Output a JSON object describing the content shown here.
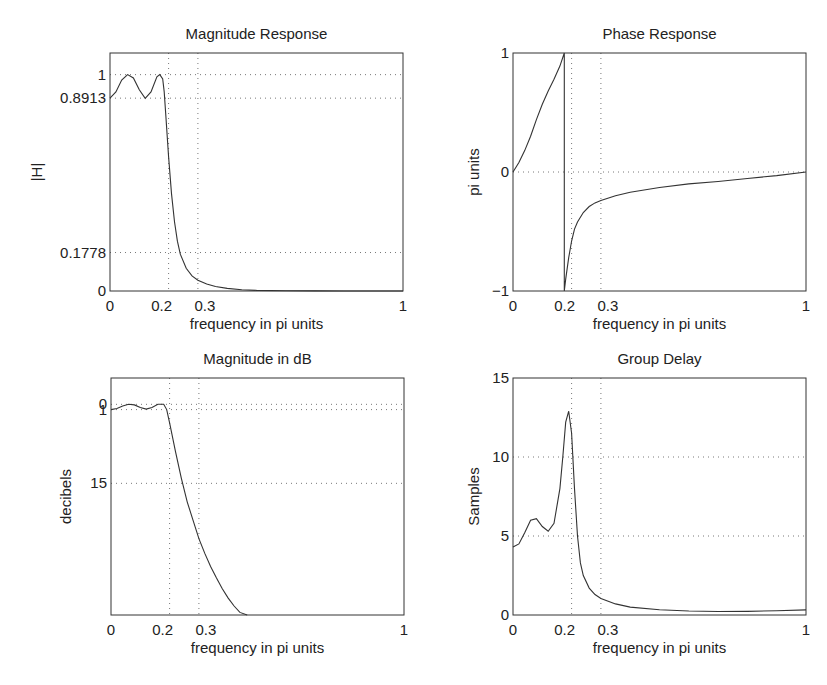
{
  "chart_data": [
    {
      "type": "line",
      "id": "mag",
      "title": "Magnitude Response",
      "xlabel": "frequency in pi units",
      "ylabel": "|H|",
      "xlim": [
        0,
        1
      ],
      "ylim": [
        0,
        1.1
      ],
      "xticks": [
        0,
        0.2,
        0.3,
        1
      ],
      "xtick_labels": [
        "0",
        "0.2",
        "0.3",
        "1"
      ],
      "yticks": [
        0,
        0.1778,
        0.8913,
        1
      ],
      "ytick_labels": [
        "0",
        "0.1778",
        "0.8913",
        "1"
      ],
      "grid": true,
      "box": {
        "x": 110,
        "y": 53,
        "w": 293,
        "h": 238
      },
      "x": [
        0,
        0.02,
        0.04,
        0.06,
        0.08,
        0.1,
        0.12,
        0.14,
        0.16,
        0.17,
        0.18,
        0.185,
        0.19,
        0.2,
        0.21,
        0.22,
        0.23,
        0.24,
        0.26,
        0.28,
        0.3,
        0.33,
        0.36,
        0.4,
        0.45,
        0.5,
        0.6,
        0.7,
        0.8,
        0.9,
        1.0
      ],
      "values": [
        0.8913,
        0.92,
        0.975,
        1.0,
        0.985,
        0.93,
        0.89,
        0.92,
        0.99,
        1.0,
        0.98,
        0.92,
        0.82,
        0.62,
        0.45,
        0.32,
        0.23,
        0.17,
        0.105,
        0.07,
        0.05,
        0.032,
        0.021,
        0.012,
        0.006,
        0.003,
        0.001,
        0.0005,
        0.0002,
        0.0001,
        0.0
      ]
    },
    {
      "type": "line",
      "id": "phase",
      "title": "Phase Response",
      "xlabel": "frequency in pi units",
      "ylabel": "pi units",
      "xlim": [
        0,
        1
      ],
      "ylim": [
        -1,
        1
      ],
      "xticks": [
        0,
        0.2,
        0.3,
        1
      ],
      "xtick_labels": [
        "0",
        "0.2",
        "0.3",
        "1"
      ],
      "yticks": [
        -1,
        0,
        1
      ],
      "ytick_labels": [
        "−1",
        "0",
        "1"
      ],
      "grid": true,
      "box": {
        "x": 513,
        "y": 53,
        "w": 293,
        "h": 238
      },
      "x": [
        0,
        0.02,
        0.04,
        0.06,
        0.08,
        0.1,
        0.12,
        0.14,
        0.16,
        0.175,
        0.175,
        0.18,
        0.19,
        0.2,
        0.21,
        0.22,
        0.24,
        0.26,
        0.28,
        0.3,
        0.35,
        0.4,
        0.5,
        0.6,
        0.7,
        0.8,
        0.9,
        1.0
      ],
      "values": [
        0.0,
        0.08,
        0.18,
        0.3,
        0.44,
        0.57,
        0.68,
        0.78,
        0.89,
        1.0,
        -1.0,
        -0.9,
        -0.72,
        -0.58,
        -0.48,
        -0.42,
        -0.34,
        -0.29,
        -0.26,
        -0.24,
        -0.2,
        -0.17,
        -0.13,
        -0.1,
        -0.08,
        -0.055,
        -0.03,
        0.0
      ]
    },
    {
      "type": "line",
      "id": "db",
      "title": "Magnitude in dB",
      "xlabel": "frequency in pi units",
      "ylabel": "decibels",
      "xlim": [
        0,
        1
      ],
      "ylim": [
        -40,
        5
      ],
      "xticks": [
        0,
        0.2,
        0.3,
        1
      ],
      "xtick_labels": [
        "0",
        "0.2",
        "0.3",
        "1"
      ],
      "yticks": [
        0,
        -1,
        -15
      ],
      "ytick_labels": [
        "0",
        "1",
        "15"
      ],
      "grid": true,
      "box": {
        "x": 111,
        "y": 378,
        "w": 293,
        "h": 237
      },
      "x": [
        0,
        0.02,
        0.04,
        0.06,
        0.08,
        0.1,
        0.12,
        0.14,
        0.16,
        0.18,
        0.19,
        0.2,
        0.22,
        0.24,
        0.26,
        0.28,
        0.3,
        0.32,
        0.34,
        0.36,
        0.38,
        0.4,
        0.42,
        0.44,
        0.465
      ],
      "values": [
        -1.0,
        -0.8,
        -0.3,
        0.0,
        -0.1,
        -0.6,
        -0.9,
        -0.6,
        0.0,
        0.0,
        -1.0,
        -3.5,
        -9,
        -14,
        -18.5,
        -22,
        -25.5,
        -28.3,
        -30.8,
        -33.0,
        -35.0,
        -36.8,
        -38.3,
        -39.5,
        -40.0
      ]
    },
    {
      "type": "line",
      "id": "gd",
      "title": "Group Delay",
      "xlabel": "frequency in pi units",
      "ylabel": "Samples",
      "xlim": [
        0,
        1
      ],
      "ylim": [
        0,
        15
      ],
      "xticks": [
        0,
        0.2,
        0.3,
        1
      ],
      "xtick_labels": [
        "0",
        "0.2",
        "0.3",
        "1"
      ],
      "yticks": [
        0,
        5,
        10,
        15
      ],
      "ytick_labels": [
        "0",
        "5",
        "10",
        "15"
      ],
      "grid": true,
      "box": {
        "x": 513,
        "y": 378,
        "w": 293,
        "h": 237
      },
      "x": [
        0,
        0.02,
        0.04,
        0.06,
        0.08,
        0.1,
        0.12,
        0.14,
        0.16,
        0.17,
        0.18,
        0.19,
        0.2,
        0.21,
        0.22,
        0.23,
        0.24,
        0.26,
        0.28,
        0.3,
        0.35,
        0.4,
        0.5,
        0.6,
        0.7,
        0.8,
        0.9,
        1.0
      ],
      "values": [
        4.3,
        4.5,
        5.2,
        6.0,
        6.1,
        5.6,
        5.3,
        5.8,
        8.0,
        10.0,
        12.2,
        12.9,
        11.5,
        8.0,
        5.0,
        3.3,
        2.5,
        1.7,
        1.3,
        1.05,
        0.7,
        0.5,
        0.33,
        0.25,
        0.22,
        0.23,
        0.27,
        0.32
      ]
    }
  ]
}
